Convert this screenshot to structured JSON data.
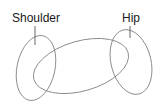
{
  "diagram": {
    "labels": {
      "shoulder": "Shoulder",
      "hip": "Hip"
    },
    "shapes": {
      "shoulder_ellipse": "left ellipse representing shoulder cross-section",
      "hip_ellipse": "right ellipse representing hip cross-section",
      "torso_body": "tilted cylinder body connecting shoulder and hip"
    },
    "colors": {
      "stroke": "#8a8a8a",
      "text": "#1a1a1a",
      "background": "#ffffff"
    }
  }
}
